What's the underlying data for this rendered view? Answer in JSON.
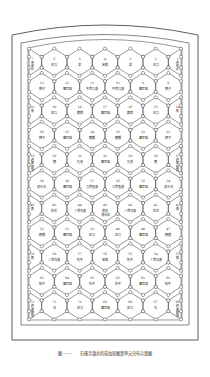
{
  "caption": {
    "figure_label": "图——",
    "text": "石佛寺藻井的花纹和图案单元分布示意图"
  },
  "colors": {
    "line": "#333333",
    "background": "#ffffff"
  },
  "grid": {
    "rows": [
      {
        "type": "half",
        "cells": [
          {
            "n": "7",
            "label": "卷草纹"
          },
          {
            "n": "6",
            "label": "风马"
          },
          {
            "n": "5",
            "label": "龙"
          },
          {
            "n": "4",
            "label": "宝瓶"
          },
          {
            "n": "3",
            "label": "龙"
          },
          {
            "n": "2",
            "label": "风马"
          },
          {
            "n": "1",
            "label": "卷草纹"
          }
        ]
      },
      {
        "type": "full",
        "cells": [
          {
            "n": "13",
            "label": "狮子"
          },
          {
            "n": "12",
            "label": "摩尼珠"
          },
          {
            "n": "11",
            "label": "牛首马身"
          },
          {
            "n": "10",
            "label": "牛首马身"
          },
          {
            "n": "9",
            "label": "摩尼珠"
          },
          {
            "n": "8",
            "label": "狮子"
          }
        ]
      },
      {
        "type": "half",
        "cells": [
          {
            "n": "20",
            "label": "龟"
          },
          {
            "n": "19",
            "label": "风马"
          },
          {
            "n": "18",
            "label": "鹦鹉"
          },
          {
            "n": "17",
            "label": "摩尼珠"
          },
          {
            "n": "16",
            "label": "鹦鹉"
          },
          {
            "n": "15",
            "label": "风马"
          },
          {
            "n": "14",
            "label": "龟"
          }
        ]
      },
      {
        "type": "full",
        "cells": [
          {
            "n": "26",
            "label": "狮子"
          },
          {
            "n": "25",
            "label": "摩尼珠"
          },
          {
            "n": "24",
            "label": "麒麟"
          },
          {
            "n": "23",
            "label": "麒麟"
          },
          {
            "n": "22",
            "label": "摩尼珠"
          },
          {
            "n": "21",
            "label": "狮子"
          }
        ]
      },
      {
        "type": "half",
        "cells": [
          {
            "n": "33",
            "label": "迦陵频伽"
          },
          {
            "n": "32",
            "label": "鹿"
          },
          {
            "n": "31",
            "label": "孔雀"
          },
          {
            "n": "30",
            "label": "摩尼珠"
          },
          {
            "n": "29",
            "label": "孔雀"
          },
          {
            "n": "28",
            "label": "鹿"
          },
          {
            "n": "27",
            "label": "迦陵频伽"
          }
        ]
      },
      {
        "type": "full",
        "cells": [
          {
            "n": "39",
            "label": "双头鸟"
          },
          {
            "n": "38",
            "label": "摩尼珠"
          },
          {
            "n": "37",
            "label": "马首鱼身"
          },
          {
            "n": "36",
            "label": "马首鱼身"
          },
          {
            "n": "35",
            "label": "摩尼珠"
          },
          {
            "n": "34",
            "label": "双头鸟"
          }
        ]
      },
      {
        "type": "half",
        "cells": [
          {
            "n": "46",
            "label": "鹅"
          },
          {
            "n": "45",
            "label": "羚羊"
          },
          {
            "n": "44",
            "label": "人首鸟身"
          },
          {
            "n": "43",
            "label": "莲花 海水纹"
          },
          {
            "n": "42",
            "label": "人首鸟身"
          },
          {
            "n": "41",
            "label": "羚羊"
          },
          {
            "n": "40",
            "label": "鹅"
          }
        ]
      },
      {
        "type": "full",
        "cells": [
          {
            "n": "52",
            "label": "野猪"
          },
          {
            "n": "51",
            "label": "摩尼珠"
          },
          {
            "n": "50",
            "label": "风马"
          },
          {
            "n": "49",
            "label": "风马"
          },
          {
            "n": "48",
            "label": "摩尼珠"
          },
          {
            "n": "47",
            "label": "野猪"
          }
        ]
      },
      {
        "type": "half",
        "cells": [
          {
            "n": "59",
            "label": "鹅"
          },
          {
            "n": "58",
            "label": "人首鸟身"
          },
          {
            "n": "57",
            "label": "牝牛"
          },
          {
            "n": "56",
            "label": "宝瓶"
          },
          {
            "n": "55",
            "label": "牝牛"
          },
          {
            "n": "54",
            "label": "人首鸟身"
          },
          {
            "n": "53",
            "label": "鹅"
          }
        ]
      },
      {
        "type": "full",
        "cells": [
          {
            "n": "65",
            "label": "牦牛"
          },
          {
            "n": "64",
            "label": "摩尼珠"
          },
          {
            "n": "63",
            "label": "牡牛"
          },
          {
            "n": "62",
            "label": "牡牛"
          },
          {
            "n": "61",
            "label": "摩尼珠"
          },
          {
            "n": "60",
            "label": "牦牛"
          }
        ]
      },
      {
        "type": "half",
        "cells": [
          {
            "n": "72",
            "label": "迦陵频伽"
          },
          {
            "n": "71",
            "label": "鸟"
          },
          {
            "n": "70",
            "label": "风马"
          },
          {
            "n": "69",
            "label": "摩尼珠"
          },
          {
            "n": "68",
            "label": "风马"
          },
          {
            "n": "67",
            "label": "鸟"
          },
          {
            "n": "66",
            "label": "迦陵频伽"
          }
        ]
      }
    ]
  }
}
